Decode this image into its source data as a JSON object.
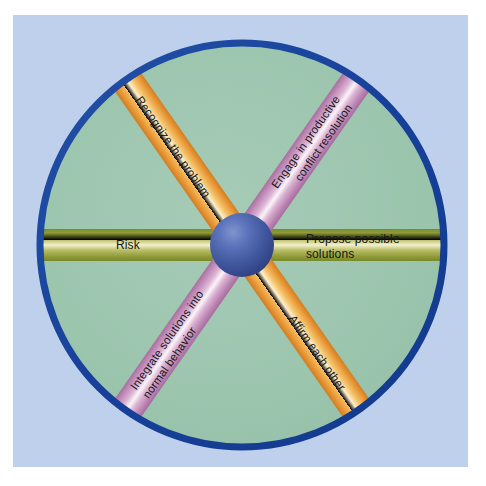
{
  "diagram": {
    "type": "radial-spoke-wheel",
    "hub": {
      "name": "center-hub",
      "label": "",
      "color": "#3a54a4"
    },
    "ring": {
      "name": "outer-ring",
      "color": "#1c4a9e",
      "fill": "#9dc4b0"
    },
    "background": {
      "panel_color": "#bed0ec",
      "page_color": "#ffffff"
    },
    "spokes": [
      {
        "id": "recognize",
        "label": "Recognize the problem",
        "lines": [
          "Recognize the problem"
        ],
        "color": "#eda13a",
        "highlight": "#fdf2cf",
        "position": "upper-left",
        "angle_deg": -125
      },
      {
        "id": "engage",
        "label": "Engage in productive conflict resolution",
        "lines": [
          "Engage in productive",
          "conflict resolution"
        ],
        "color": "#c48cbb",
        "highlight": "#ffffff",
        "position": "upper-right",
        "angle_deg": -55
      },
      {
        "id": "propose",
        "label": "Propose possible solutions",
        "lines": [
          "Propose possible",
          "solutions"
        ],
        "color": "#9aa23c",
        "highlight": "#f3f0cf",
        "position": "right",
        "angle_deg": 0
      },
      {
        "id": "affirm",
        "label": "Affirm each other",
        "lines": [
          "Affirm each other"
        ],
        "color": "#eda13a",
        "highlight": "#fdf2cf",
        "position": "lower-right",
        "angle_deg": 55
      },
      {
        "id": "integrate",
        "label": "Integrate solutions into normal behavior",
        "lines": [
          "Integrate solutions into",
          "normal behavior"
        ],
        "color": "#c48cbb",
        "highlight": "#ffffff",
        "position": "lower-left",
        "angle_deg": 125
      },
      {
        "id": "risk",
        "label": "Risk",
        "lines": [
          "Risk"
        ],
        "color": "#9aa23c",
        "highlight": "#f3f0cf",
        "position": "left",
        "angle_deg": 180
      }
    ]
  }
}
